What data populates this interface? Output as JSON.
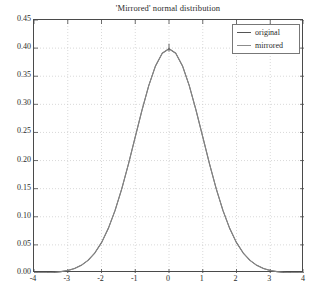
{
  "chart_data": {
    "type": "line",
    "title": "'Mirrored' normal distribution",
    "xlabel": "",
    "ylabel": "",
    "xlim": [
      -4,
      4
    ],
    "ylim": [
      0.0,
      0.45
    ],
    "grid": true,
    "grid_style": "dotted",
    "legend_position": "upper right",
    "xticks": [
      "-4",
      "-3",
      "-2",
      "-1",
      "0",
      "1",
      "2",
      "3",
      "4"
    ],
    "xtick_values": [
      -4,
      -3,
      -2,
      -1,
      0,
      1,
      2,
      3,
      4
    ],
    "yticks": [
      "0.00",
      "0.05",
      "0.10",
      "0.15",
      "0.20",
      "0.25",
      "0.30",
      "0.35",
      "0.40",
      "0.45"
    ],
    "ytick_values": [
      0.0,
      0.05,
      0.1,
      0.15,
      0.2,
      0.25,
      0.3,
      0.35,
      0.4,
      0.45
    ],
    "series": [
      {
        "name": "original",
        "color": "#555555",
        "x": [
          -4.0,
          -3.8,
          -3.6,
          -3.4,
          -3.2,
          -3.0,
          -2.8,
          -2.6,
          -2.4,
          -2.2,
          -2.0,
          -1.8,
          -1.6,
          -1.4,
          -1.2,
          -1.0,
          -0.8,
          -0.6,
          -0.4,
          -0.2,
          0.0,
          0.2,
          0.4,
          0.6,
          0.8,
          1.0,
          1.2,
          1.4,
          1.6,
          1.8,
          2.0,
          2.2,
          2.4,
          2.6,
          2.8,
          3.0,
          3.2,
          3.4,
          3.6,
          3.8,
          4.0
        ],
        "values": [
          0.0001,
          0.0003,
          0.0006,
          0.0012,
          0.0024,
          0.0044,
          0.0079,
          0.0136,
          0.0224,
          0.0355,
          0.054,
          0.079,
          0.1109,
          0.1497,
          0.1942,
          0.242,
          0.2897,
          0.3332,
          0.3683,
          0.391,
          0.3989,
          0.391,
          0.3683,
          0.3332,
          0.2897,
          0.242,
          0.1942,
          0.1497,
          0.1109,
          0.079,
          0.054,
          0.0355,
          0.0224,
          0.0136,
          0.0079,
          0.0044,
          0.0024,
          0.0012,
          0.0006,
          0.0003,
          0.0001
        ]
      },
      {
        "name": "mirrored",
        "color": "#8c8c8c",
        "x": [
          -4.0,
          -3.8,
          -3.6,
          -3.4,
          -3.2,
          -3.0,
          -2.8,
          -2.6,
          -2.4,
          -2.2,
          -2.0,
          -1.8,
          -1.6,
          -1.4,
          -1.2,
          -1.0,
          -0.8,
          -0.6,
          -0.4,
          -0.2,
          0.0,
          0.2,
          0.4,
          0.6,
          0.8,
          1.0,
          1.2,
          1.4,
          1.6,
          1.8,
          2.0,
          2.2,
          2.4,
          2.6,
          2.8,
          3.0,
          3.2,
          3.4,
          3.6,
          3.8,
          4.0
        ],
        "values": [
          0.0001,
          0.0003,
          0.0006,
          0.0012,
          0.0024,
          0.0044,
          0.0079,
          0.0136,
          0.0224,
          0.0355,
          0.054,
          0.079,
          0.1109,
          0.1497,
          0.1942,
          0.242,
          0.2897,
          0.3332,
          0.3683,
          0.391,
          0.3989,
          0.391,
          0.3683,
          0.3332,
          0.2897,
          0.242,
          0.1942,
          0.1497,
          0.1109,
          0.079,
          0.054,
          0.0355,
          0.0224,
          0.0136,
          0.0079,
          0.0044,
          0.0024,
          0.0012,
          0.0006,
          0.0003,
          0.0001
        ]
      }
    ],
    "annotations": [
      {
        "name": "peak-marker",
        "x": 0.0,
        "y": 0.3989,
        "style": "vertical-tick"
      }
    ]
  },
  "legend": {
    "entries": [
      {
        "label": "original"
      },
      {
        "label": "mirrored"
      }
    ]
  },
  "colors": {
    "axis": "#4a4a4a",
    "grid": "#c8c8c8",
    "background": "#ffffff",
    "text": "#2b2b2b",
    "curve_original": "#555555",
    "curve_mirrored": "#8c8c8c"
  }
}
